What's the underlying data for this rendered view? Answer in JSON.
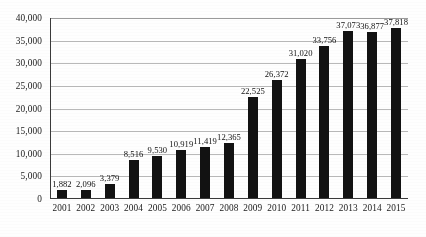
{
  "chart_data": {
    "type": "bar",
    "title": "",
    "subtitle": "",
    "xlabel": "",
    "ylabel": "",
    "categories": [
      "2001",
      "2002",
      "2003",
      "2004",
      "2005",
      "2006",
      "2007",
      "2008",
      "2009",
      "2010",
      "2011",
      "2012",
      "2013",
      "2014",
      "2015"
    ],
    "values": [
      1882,
      2096,
      3379,
      8516,
      9530,
      10919,
      11419,
      12365,
      22525,
      26372,
      31020,
      33756,
      37073,
      36877,
      37818
    ],
    "value_labels": [
      "1,882",
      "2,096",
      "3,379",
      "8,516",
      "9,530",
      "10,919",
      "11,419",
      "12,365",
      "22,525",
      "26,372",
      "31,020",
      "33,756",
      "37,073",
      "36,877",
      "37,818"
    ],
    "ylim": [
      0,
      40000
    ],
    "ytick_values": [
      0,
      5000,
      10000,
      15000,
      20000,
      25000,
      30000,
      35000,
      40000
    ],
    "ytick_labels": [
      "0",
      "5,000",
      "10,000",
      "15,000",
      "20,000",
      "25,000",
      "30,000",
      "35,000",
      "40,000"
    ],
    "grid": "horizontal",
    "legend": "none",
    "bar_color": "#121212",
    "gridline_color": "#b9b9b9",
    "axis_color": "#3a3a3a",
    "text_color": "#1a1a1a",
    "show_value_labels": true
  }
}
